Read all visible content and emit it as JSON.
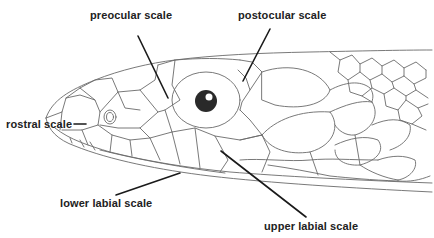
{
  "diagram": {
    "labels": {
      "preocular": "preocular scale",
      "postocular": "postocular scale",
      "rostral": "rostral scale",
      "lower_labial": "lower labial scale",
      "upper_labial": "upper labial scale"
    },
    "colors": {
      "background": "#ffffff",
      "outline": "#6a6a6a",
      "leader_line": "#1a1a1a",
      "label_text": "#222222",
      "eye": "#2a2a2a"
    }
  }
}
